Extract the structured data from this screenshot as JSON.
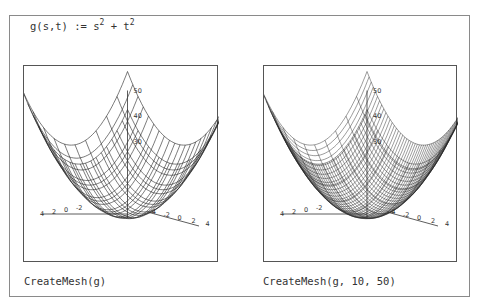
{
  "formula": {
    "lhs": "g(s,t) := s",
    "exp1": "2",
    "mid": " + t",
    "exp2": "2"
  },
  "plots": [
    {
      "caption": "CreateMesh(g)",
      "grid": "coarse",
      "z_ticks": [
        "50",
        "40",
        "30"
      ],
      "axis_left_ticks": [
        "4",
        "2",
        "0",
        "-2"
      ],
      "axis_right_ticks": [
        "-4",
        "-2",
        "0",
        "2",
        "4"
      ]
    },
    {
      "caption": "CreateMesh(g, 10, 50)",
      "grid": "fine",
      "z_ticks": [
        "50",
        "40",
        "30"
      ],
      "axis_left_ticks": [
        "4",
        "2",
        "0",
        "-2"
      ],
      "axis_right_ticks": [
        "-4",
        "-2",
        "0",
        "2",
        "4"
      ]
    }
  ],
  "colors": {
    "mesh": "#222222",
    "frame": "#8a8a8a",
    "text": "#333333"
  }
}
